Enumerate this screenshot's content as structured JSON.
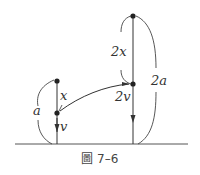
{
  "figure": {
    "caption_prefix": "圖",
    "caption_number": "7–6"
  },
  "labels": {
    "left_height": "a",
    "left_upper_segment": "x",
    "left_velocity": "v",
    "right_upper_segment": "2x",
    "right_velocity": "2v",
    "right_height": "2a"
  },
  "colors": {
    "line": "#333333",
    "dot": "#222222",
    "background": "#ffffff"
  }
}
